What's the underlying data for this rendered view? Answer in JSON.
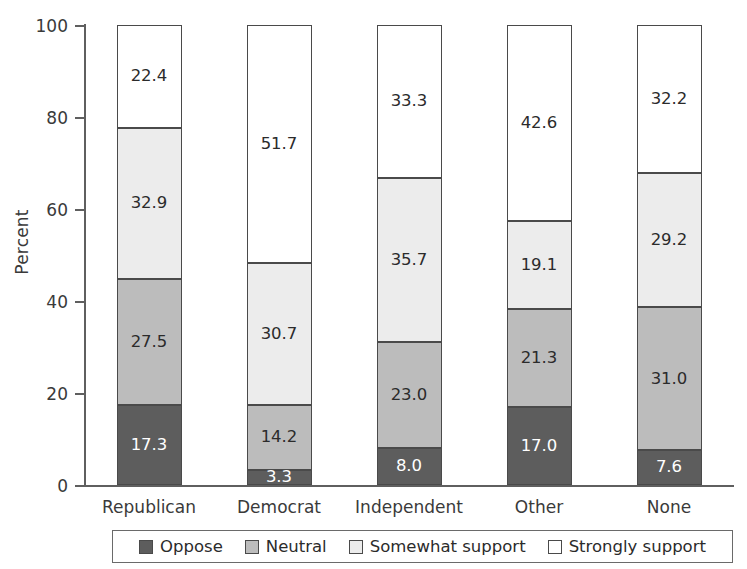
{
  "chart_data": {
    "type": "bar",
    "subtype": "stacked-bar-100",
    "title": "",
    "xlabel": "",
    "ylabel": "Percent",
    "ylim": [
      0,
      100
    ],
    "yticks": [
      0,
      20,
      40,
      60,
      80,
      100
    ],
    "ytick_labels": [
      "0",
      "20",
      "40",
      "60",
      "80",
      "100"
    ],
    "grid": false,
    "legend_position": "bottom",
    "categories": [
      "Republican",
      "Democrat",
      "Independent",
      "Other",
      "None"
    ],
    "series": [
      {
        "name": "Oppose",
        "color": "#5d5d5d",
        "label_color": "#ffffff",
        "values": [
          17.3,
          3.3,
          8.0,
          17.0,
          7.6
        ],
        "value_labels": [
          "17.3",
          "3.3",
          "8.0",
          "17.0",
          "7.6"
        ]
      },
      {
        "name": "Neutral",
        "color": "#bcbcbc",
        "label_color": "#2b2b2b",
        "values": [
          27.5,
          14.2,
          23.0,
          21.3,
          31.0
        ],
        "value_labels": [
          "27.5",
          "14.2",
          "23.0",
          "21.3",
          "31.0"
        ]
      },
      {
        "name": "Somewhat support",
        "color": "#ececec",
        "label_color": "#2b2b2b",
        "values": [
          32.9,
          30.7,
          35.7,
          19.1,
          29.2
        ],
        "value_labels": [
          "32.9",
          "30.7",
          "35.7",
          "19.1",
          "29.2"
        ]
      },
      {
        "name": "Strongly support",
        "color": "#ffffff",
        "label_color": "#2b2b2b",
        "values": [
          22.4,
          51.7,
          33.3,
          42.6,
          32.2
        ],
        "value_labels": [
          "22.4",
          "51.7",
          "33.3",
          "42.6",
          "32.2"
        ]
      }
    ]
  },
  "legend": {
    "items": [
      {
        "label": "Oppose",
        "color": "#5d5d5d"
      },
      {
        "label": "Neutral",
        "color": "#bcbcbc"
      },
      {
        "label": "Somewhat support",
        "color": "#ececec"
      },
      {
        "label": "Strongly support",
        "color": "#ffffff"
      }
    ]
  },
  "axis": {
    "y_title": "Percent"
  }
}
